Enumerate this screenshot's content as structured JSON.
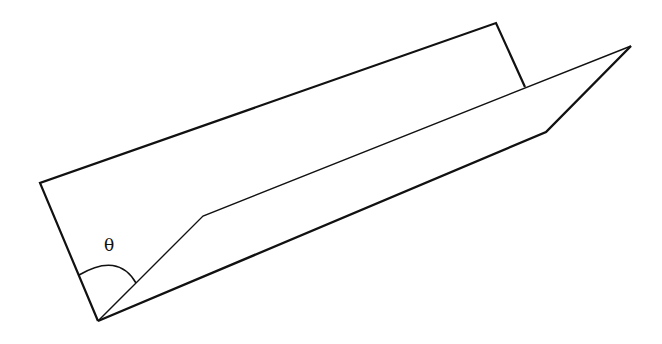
{
  "diagram": {
    "title": "",
    "angle_label": "θ",
    "colors": {
      "stroke": "#111111",
      "background": "#ffffff"
    },
    "points": {
      "bottom_vertex": [
        98,
        321
      ],
      "back_panel_top_left": [
        40,
        183
      ],
      "back_panel_top_right": [
        496,
        23
      ],
      "back_panel_fold_right": [
        525,
        87
      ],
      "front_panel_tip": [
        631,
        46
      ],
      "front_panel_bottom_right": [
        546,
        132
      ],
      "inner_fold_bend": [
        203,
        216
      ]
    }
  }
}
